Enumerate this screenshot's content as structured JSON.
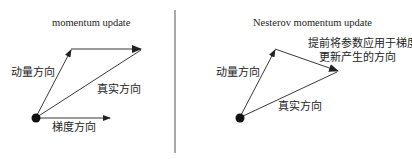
{
  "left_panel": {
    "title": "momentum update",
    "momentum_label": "动量方向",
    "true_label": "真实方向",
    "gradient_label": "梯度方向"
  },
  "right_panel": {
    "title": "Nesterov momentum update",
    "momentum_label": "动量方向",
    "true_label": "真实方向",
    "lookahead_label_line1": "提前将参数应用于梯度",
    "lookahead_label_line2": "更新产生的方向"
  },
  "colors": {
    "stroke": "#222222",
    "background": "#ffffff",
    "divider": "#555555"
  }
}
